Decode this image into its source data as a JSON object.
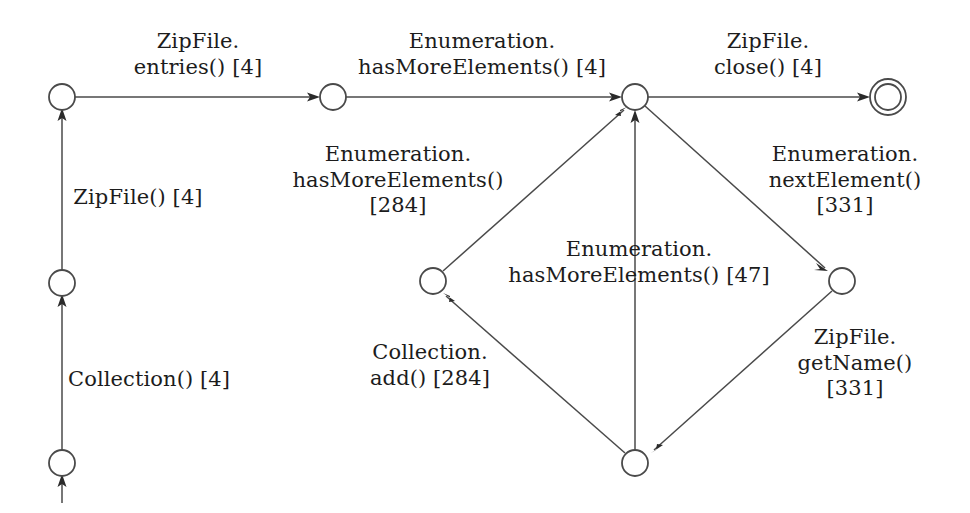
{
  "diagram": {
    "kind": "finite-state-machine",
    "title": "",
    "stroke_color": "#4a4a4a",
    "text_color": "#1c1c1c",
    "background": "#ffffff",
    "nodes": [
      {
        "id": "n0",
        "name": "start-state",
        "x": 62,
        "y": 463,
        "r": 13,
        "accepting": false
      },
      {
        "id": "n1",
        "name": "state-collection",
        "x": 62,
        "y": 283,
        "r": 13,
        "accepting": false
      },
      {
        "id": "n2",
        "name": "state-zipfile",
        "x": 62,
        "y": 97,
        "r": 13,
        "accepting": false
      },
      {
        "id": "n3",
        "name": "state-entries",
        "x": 333,
        "y": 97,
        "r": 13,
        "accepting": false
      },
      {
        "id": "n4",
        "name": "state-hub",
        "x": 635,
        "y": 97,
        "r": 13,
        "accepting": false
      },
      {
        "id": "n5",
        "name": "state-diamond-left",
        "x": 433,
        "y": 281,
        "r": 13,
        "accepting": false
      },
      {
        "id": "n6",
        "name": "state-diamond-right",
        "x": 842,
        "y": 281,
        "r": 13,
        "accepting": false
      },
      {
        "id": "n7",
        "name": "state-diamond-bottom",
        "x": 635,
        "y": 463,
        "r": 13,
        "accepting": false
      },
      {
        "id": "n8",
        "name": "state-final",
        "x": 888,
        "y": 97,
        "r": 13,
        "accepting": true,
        "outer_r": 18
      }
    ],
    "edges": [
      {
        "id": "e0",
        "name": "edge-start-entry",
        "from": null,
        "to": "n0",
        "label_id": null
      },
      {
        "id": "e1",
        "name": "edge-collection",
        "from": "n0",
        "to": "n1",
        "label_id": "l_collection"
      },
      {
        "id": "e2",
        "name": "edge-zipfile-ctor",
        "from": "n1",
        "to": "n2",
        "label_id": "l_zipfile_ctor"
      },
      {
        "id": "e3",
        "name": "edge-zipfile-entries",
        "from": "n2",
        "to": "n3",
        "label_id": "l_entries"
      },
      {
        "id": "e4",
        "name": "edge-hasmoreelements-4",
        "from": "n3",
        "to": "n4",
        "label_id": "l_hasmore4"
      },
      {
        "id": "e5",
        "name": "edge-zipfile-close",
        "from": "n4",
        "to": "n8",
        "label_id": "l_close"
      },
      {
        "id": "e6",
        "name": "edge-nextelement",
        "from": "n4",
        "to": "n6",
        "label_id": "l_nextelement"
      },
      {
        "id": "e7",
        "name": "edge-getname",
        "from": "n6",
        "to": "n7",
        "label_id": "l_getname"
      },
      {
        "id": "e8",
        "name": "edge-collection-add",
        "from": "n7",
        "to": "n5",
        "label_id": "l_add"
      },
      {
        "id": "e9",
        "name": "edge-hasmoreelements-284",
        "from": "n5",
        "to": "n4",
        "label_id": "l_hasmore284"
      },
      {
        "id": "e10",
        "name": "edge-hasmoreelements-47",
        "from": "n7",
        "to": "n4",
        "label_id": "l_hasmore47"
      }
    ],
    "labels": [
      {
        "id": "l_entries",
        "name": "label-zipfile-entries",
        "lines": [
          "ZipFile.",
          "entries() [4]"
        ],
        "text": "ZipFile.\nentries() [4]",
        "x": 198,
        "y": 29,
        "align": "center"
      },
      {
        "id": "l_hasmore4",
        "name": "label-hasmoreelements-4",
        "lines": [
          "Enumeration.",
          "hasMoreElements() [4]"
        ],
        "text": "Enumeration.\nhasMoreElements() [4]",
        "x": 482,
        "y": 29,
        "align": "center"
      },
      {
        "id": "l_close",
        "name": "label-zipfile-close",
        "lines": [
          "ZipFile.",
          "close() [4]"
        ],
        "text": "ZipFile.\nclose() [4]",
        "x": 768,
        "y": 29,
        "align": "center"
      },
      {
        "id": "l_zipfile_ctor",
        "name": "label-zipfile-constructor",
        "lines": [
          "ZipFile() [4]"
        ],
        "text": "ZipFile() [4]",
        "x": 138,
        "y": 185,
        "align": "center"
      },
      {
        "id": "l_collection",
        "name": "label-collection-constructor",
        "lines": [
          "Collection() [4]"
        ],
        "text": "Collection() [4]",
        "x": 148,
        "y": 367,
        "align": "center"
      },
      {
        "id": "l_hasmore284",
        "name": "label-hasmoreelements-284",
        "lines": [
          "Enumeration.",
          "hasMoreElements()",
          "[284]"
        ],
        "text": "Enumeration.\nhasMoreElements()\n[284]",
        "x": 398,
        "y": 142,
        "align": "center"
      },
      {
        "id": "l_nextelement",
        "name": "label-enumeration-nextelement",
        "lines": [
          "Enumeration.",
          "nextElement()",
          "[331]"
        ],
        "text": "Enumeration.\nnextElement()\n[331]",
        "x": 845,
        "y": 142,
        "align": "center"
      },
      {
        "id": "l_hasmore47",
        "name": "label-hasmoreelements-47",
        "lines": [
          "Enumeration.",
          "hasMoreElements() [47]"
        ],
        "text": "Enumeration.\nhasMoreElements() [47]",
        "x": 639,
        "y": 237,
        "align": "center"
      },
      {
        "id": "l_add",
        "name": "label-collection-add",
        "lines": [
          "Collection.",
          "add() [284]"
        ],
        "text": "Collection.\nadd() [284]",
        "x": 430,
        "y": 340,
        "align": "center"
      },
      {
        "id": "l_getname",
        "name": "label-zipfile-getname",
        "lines": [
          "ZipFile.",
          "getName()",
          "[331]"
        ],
        "text": "ZipFile.\ngetName()\n[331]",
        "x": 855,
        "y": 325,
        "align": "center"
      }
    ]
  }
}
